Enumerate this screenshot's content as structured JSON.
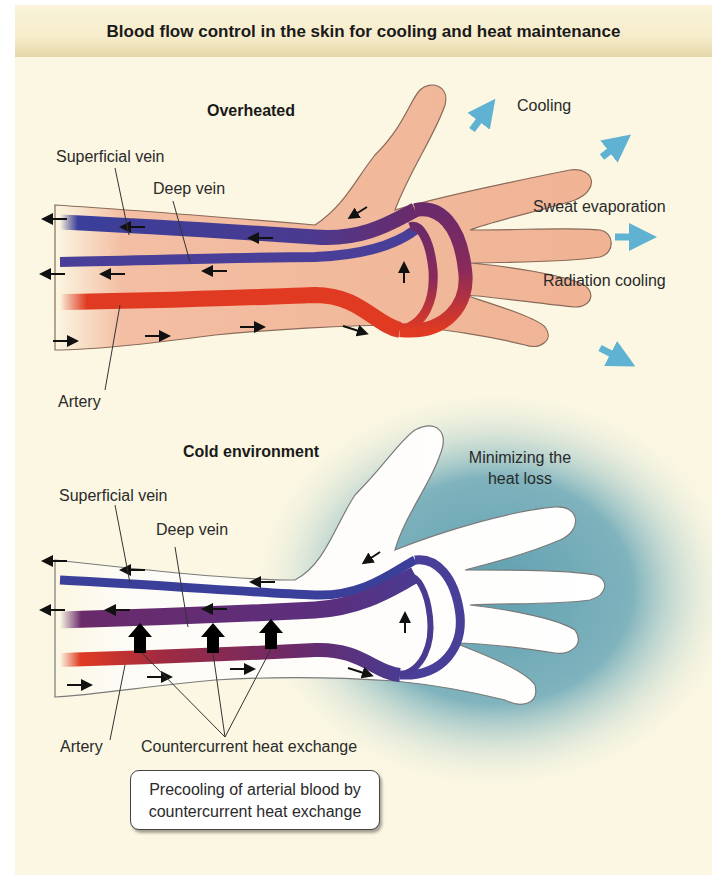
{
  "title": "Blood flow control in the skin for cooling and heat maintenance",
  "overheated": {
    "heading": "Overheated",
    "labels": {
      "superficial_vein": "Superficial vein",
      "deep_vein": "Deep vein",
      "artery": "Artery"
    },
    "effects": [
      "Cooling",
      "Sweat evaporation",
      "Radiation cooling"
    ]
  },
  "cold": {
    "heading": "Cold environment",
    "labels": {
      "superficial_vein": "Superficial vein",
      "deep_vein": "Deep vein",
      "artery": "Artery",
      "countercurrent": "Countercurrent heat exchange"
    },
    "note_line1": "Minimizing the",
    "note_line2": "heat loss",
    "callout_line1": "Precooling of arterial blood by",
    "callout_line2": "countercurrent heat exchange"
  },
  "colors": {
    "background": "#fbf7e2",
    "warm_skin": "#f2b89c",
    "cold_skin": "#fdfbf6",
    "vein_blue": "#3a3f9a",
    "artery_red": "#e03a22",
    "mixed_purple": "#6a2a6a",
    "cold_halo": "#6ea9b8",
    "heat_arrow": "#5fb2d2"
  }
}
